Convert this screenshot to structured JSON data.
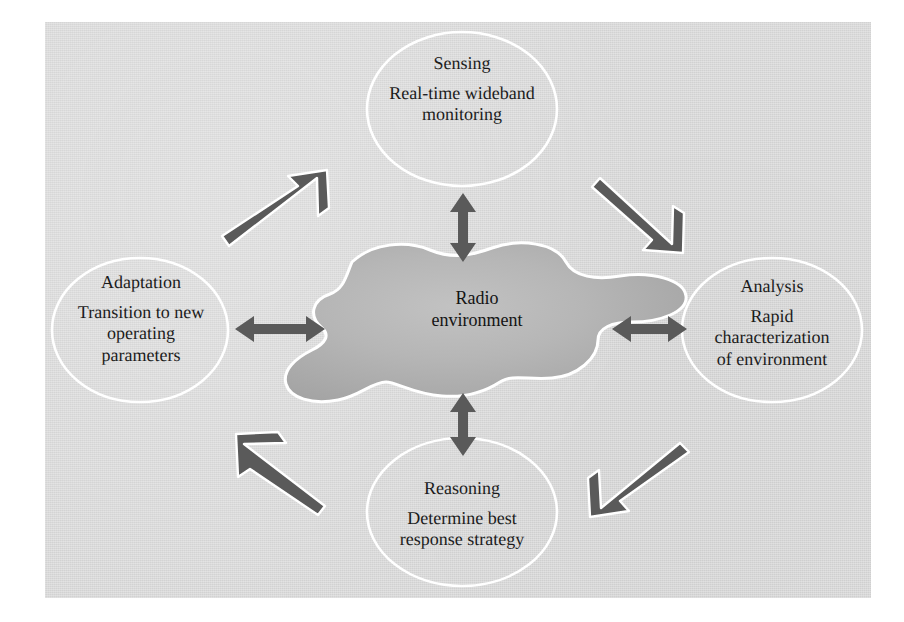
{
  "figure": {
    "background_color": "#d9d9d9",
    "panel_color": "#d9d9d9",
    "page_color": "#ffffff",
    "text_color": "#1b1b1b",
    "node_stroke_color": "#ffffff",
    "arrow_color": "#5a5a5a",
    "blob_fill_color": "#b4b4b4"
  },
  "center": {
    "name": "radio-environment",
    "label_line1": "Radio",
    "label_line2": "environment",
    "shape": "blob"
  },
  "nodes": [
    {
      "id": "sensing",
      "title": "Sensing",
      "desc_line1": "Real-time wideband",
      "desc_line2": "monitoring",
      "position": "top"
    },
    {
      "id": "analysis",
      "title": "Analysis",
      "desc_line1": "Rapid",
      "desc_line2": "characterization",
      "desc_line3": "of environment",
      "position": "right"
    },
    {
      "id": "reasoning",
      "title": "Reasoning",
      "desc_line1": "Determine best",
      "desc_line2": "response strategy",
      "position": "bottom"
    },
    {
      "id": "adaptation",
      "title": "Adaptation",
      "desc_line1": "Transition to new",
      "desc_line2": "operating",
      "desc_line3": "parameters",
      "position": "left"
    }
  ],
  "connectors": {
    "bidirectional": [
      {
        "id": "sensing-to-center",
        "from": "sensing",
        "to": "radio-environment",
        "orientation": "vertical"
      },
      {
        "id": "analysis-to-center",
        "from": "analysis",
        "to": "radio-environment",
        "orientation": "horizontal"
      },
      {
        "id": "reasoning-to-center",
        "from": "reasoning",
        "to": "radio-environment",
        "orientation": "vertical"
      },
      {
        "id": "adaptation-to-center",
        "from": "adaptation",
        "to": "radio-environment",
        "orientation": "horizontal"
      }
    ],
    "cycle": [
      {
        "id": "adaptation-to-sensing",
        "from": "adaptation",
        "to": "sensing",
        "direction": "up-right"
      },
      {
        "id": "sensing-to-analysis",
        "from": "sensing",
        "to": "analysis",
        "direction": "down-right"
      },
      {
        "id": "analysis-to-reasoning",
        "from": "analysis",
        "to": "reasoning",
        "direction": "down-left"
      },
      {
        "id": "reasoning-to-adaptation",
        "from": "reasoning",
        "to": "adaptation",
        "direction": "up-left"
      }
    ]
  }
}
